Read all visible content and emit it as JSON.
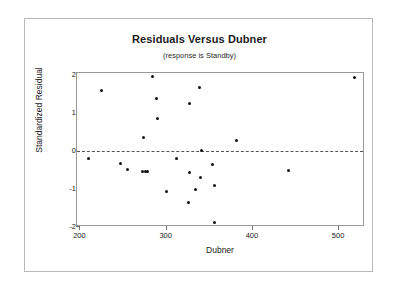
{
  "chart_data": {
    "type": "scatter",
    "title": "Residuals Versus Dubner",
    "subtitle": "(response is Standby)",
    "xlabel": "Dubner",
    "ylabel": "Standardized Residual",
    "xlim": [
      196,
      530
    ],
    "ylim": [
      -2.0,
      2.05
    ],
    "xticks": [
      200,
      300,
      400,
      500
    ],
    "yticks": [
      2,
      1,
      0,
      -1,
      -2
    ],
    "grid": false,
    "legend": null,
    "reference_line": {
      "y": 0,
      "style": "dashed",
      "color": "#555555"
    },
    "marker": {
      "shape": "circle",
      "color": "#111111",
      "size": 3
    },
    "points": [
      {
        "x": 209,
        "y": -0.21
      },
      {
        "x": 224,
        "y": 1.58
      },
      {
        "x": 246,
        "y": -0.33
      },
      {
        "x": 254,
        "y": -0.5
      },
      {
        "x": 272,
        "y": -0.53
      },
      {
        "x": 275,
        "y": -0.55
      },
      {
        "x": 278,
        "y": -0.54
      },
      {
        "x": 273,
        "y": 0.35
      },
      {
        "x": 283,
        "y": 1.95
      },
      {
        "x": 288,
        "y": 1.39
      },
      {
        "x": 289,
        "y": 0.85
      },
      {
        "x": 300,
        "y": -1.06
      },
      {
        "x": 311,
        "y": -0.21
      },
      {
        "x": 326,
        "y": 1.24
      },
      {
        "x": 327,
        "y": -0.56
      },
      {
        "x": 325,
        "y": -1.36
      },
      {
        "x": 333,
        "y": -1.01
      },
      {
        "x": 338,
        "y": 1.66
      },
      {
        "x": 340,
        "y": 0.0
      },
      {
        "x": 339,
        "y": -0.69
      },
      {
        "x": 353,
        "y": -0.36
      },
      {
        "x": 355,
        "y": -0.9
      },
      {
        "x": 356,
        "y": -1.88
      },
      {
        "x": 381,
        "y": 0.27
      },
      {
        "x": 441,
        "y": -0.52
      },
      {
        "x": 518,
        "y": 1.94
      }
    ]
  }
}
